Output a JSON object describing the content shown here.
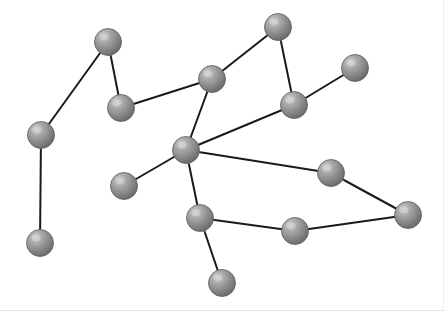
{
  "figure": {
    "kind": "node-link-network-diagram",
    "width": 444,
    "height": 311,
    "background_color": "#ffffff",
    "border_color": "#e2e2e2",
    "node_count": 15,
    "edge_count": 16
  },
  "style": {
    "node_radius": 13.5,
    "node_base_color": "#8c8c8c",
    "node_highlight_color": "#c9c9c9",
    "node_mid_color": "#9a9a9a",
    "node_edge_color": "#5e5e5e",
    "node_shadow_color": "#bdbdbd",
    "edge_color": "#1a1a1a",
    "edge_width": 2.0
  },
  "graph_data": {
    "type": "graph",
    "directed": false,
    "layout": "pixel-coordinates",
    "nodes": [
      {
        "id": "n1",
        "label": "",
        "x": 108,
        "y": 42,
        "degree": 2
      },
      {
        "id": "n2",
        "label": "",
        "x": 41,
        "y": 135,
        "degree": 2
      },
      {
        "id": "n3",
        "label": "",
        "x": 40,
        "y": 243,
        "degree": 1
      },
      {
        "id": "n4",
        "label": "",
        "x": 121,
        "y": 108,
        "degree": 2
      },
      {
        "id": "n5",
        "label": "",
        "x": 212,
        "y": 79,
        "degree": 3
      },
      {
        "id": "n6",
        "label": "",
        "x": 278,
        "y": 27,
        "degree": 2
      },
      {
        "id": "n7",
        "label": "",
        "x": 294,
        "y": 105,
        "degree": 3
      },
      {
        "id": "n8",
        "label": "",
        "x": 355,
        "y": 68,
        "degree": 1
      },
      {
        "id": "n9",
        "label": "",
        "x": 186,
        "y": 150,
        "degree": 5
      },
      {
        "id": "n10",
        "label": "",
        "x": 124,
        "y": 186,
        "degree": 1
      },
      {
        "id": "n11",
        "label": "",
        "x": 200,
        "y": 218,
        "degree": 3
      },
      {
        "id": "n12",
        "label": "",
        "x": 222,
        "y": 283,
        "degree": 1
      },
      {
        "id": "n13",
        "label": "",
        "x": 295,
        "y": 231,
        "degree": 2
      },
      {
        "id": "n14",
        "label": "",
        "x": 331,
        "y": 173,
        "degree": 2
      },
      {
        "id": "n15",
        "label": "",
        "x": 408,
        "y": 215,
        "degree": 2
      }
    ],
    "edges": [
      {
        "source": "n1",
        "target": "n2"
      },
      {
        "source": "n1",
        "target": "n4"
      },
      {
        "source": "n2",
        "target": "n3"
      },
      {
        "source": "n4",
        "target": "n5"
      },
      {
        "source": "n5",
        "target": "n6"
      },
      {
        "source": "n5",
        "target": "n9"
      },
      {
        "source": "n6",
        "target": "n7"
      },
      {
        "source": "n7",
        "target": "n8"
      },
      {
        "source": "n7",
        "target": "n9"
      },
      {
        "source": "n9",
        "target": "n10"
      },
      {
        "source": "n9",
        "target": "n11"
      },
      {
        "source": "n9",
        "target": "n14"
      },
      {
        "source": "n11",
        "target": "n12"
      },
      {
        "source": "n11",
        "target": "n13"
      },
      {
        "source": "n13",
        "target": "n15"
      },
      {
        "source": "n14",
        "target": "n15"
      }
    ]
  }
}
